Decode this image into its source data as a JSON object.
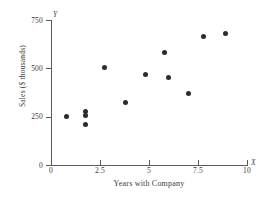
{
  "chart_data": {
    "type": "scatter",
    "title": "",
    "xlabel": "Years with Company",
    "ylabel": "Sales ($ thousands)",
    "x_var_symbol": "X",
    "y_var_symbol": "Y",
    "xlim": [
      0,
      10
    ],
    "ylim": [
      0,
      750
    ],
    "grid": false,
    "legend": null,
    "xticks": [
      "0",
      "2.5",
      "5",
      "7.5",
      "10"
    ],
    "xtick_values": [
      0,
      2.5,
      5,
      7.5,
      10
    ],
    "yticks": [
      "0",
      "250",
      "500",
      "750"
    ],
    "ytick_values": [
      0,
      250,
      500,
      750
    ],
    "marker": "filled-circle",
    "marker_color": "#2b2b2b",
    "axis_color": "#5b5b5b",
    "n_points": 12,
    "points": [
      {
        "x": 0.8,
        "y": 250
      },
      {
        "x": 1.75,
        "y": 275
      },
      {
        "x": 1.75,
        "y": 258
      },
      {
        "x": 1.75,
        "y": 212
      },
      {
        "x": 2.75,
        "y": 505
      },
      {
        "x": 3.8,
        "y": 325
      },
      {
        "x": 4.8,
        "y": 470
      },
      {
        "x": 5.8,
        "y": 580
      },
      {
        "x": 6.0,
        "y": 455
      },
      {
        "x": 7.0,
        "y": 372
      },
      {
        "x": 7.8,
        "y": 665
      },
      {
        "x": 8.9,
        "y": 680
      }
    ]
  }
}
